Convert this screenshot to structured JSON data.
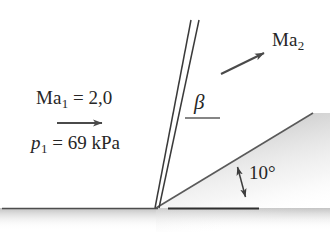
{
  "figure": {
    "background_color": "#ffffff",
    "line_color": "#3a3a3a",
    "shade_color": "#b8b8b8",
    "width": 330,
    "height": 232
  },
  "labels": {
    "upstream_mach": {
      "symbol": "Ma",
      "subscript": "1",
      "equals": "=",
      "value": "2,0",
      "text": "Ma1 = 2,0"
    },
    "upstream_pressure": {
      "symbol": "p",
      "subscript": "1",
      "equals": "=",
      "value": "69",
      "unit": "kPa",
      "text": "p1 = 69 kPa"
    },
    "downstream_mach": {
      "symbol": "Ma",
      "subscript": "2",
      "text": "Ma2"
    },
    "shock_angle": {
      "symbol": "β",
      "text": "β"
    },
    "wedge_angle": {
      "value": "10",
      "unit": "°",
      "text": "10°"
    }
  },
  "geometry": {
    "apex": {
      "x": 156,
      "y": 208
    },
    "ground_line": {
      "x1": 2,
      "y1": 208,
      "x2": 156,
      "y2": 208
    },
    "wedge_surface": {
      "x1": 156,
      "y1": 208,
      "x2": 313,
      "y2": 113,
      "angle_degrees": 10
    },
    "shock_wave": {
      "x1": 156,
      "y1": 208,
      "x2": 196,
      "y2": 20,
      "style": "double-line"
    },
    "reference_line_horizontal": {
      "x1": 168,
      "y1": 208,
      "x2": 258,
      "y2": 208
    },
    "reference_line_beta": {
      "x1": 185,
      "y1": 118,
      "x2": 219,
      "y2": 118
    },
    "arrow_upstream": {
      "x1": 57,
      "y1": 123,
      "x2": 107,
      "y2": 123,
      "heads": 1
    },
    "arrow_downstream": {
      "x1": 221,
      "y1": 74,
      "x2": 269,
      "y2": 51,
      "heads": 1
    },
    "arrow_wedge_angle": {
      "x1": 237,
      "y1": 162,
      "x2": 246,
      "y2": 202,
      "heads": 2
    }
  }
}
